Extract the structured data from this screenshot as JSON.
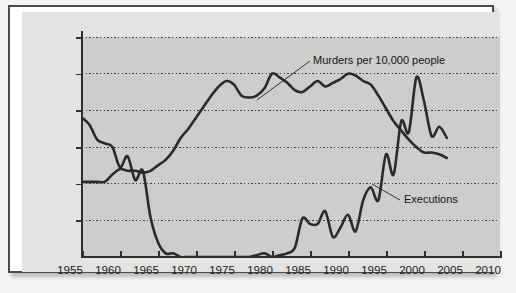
{
  "chart_data": {
    "type": "line",
    "title": "",
    "xlabel": "",
    "ylabel": "",
    "xlim": [
      1955,
      2010
    ],
    "ylim": [
      0,
      120
    ],
    "grid": true,
    "grid_style": "dotted horizontal",
    "legend": "inline annotations",
    "xticks": [
      "1955",
      "1960",
      "1965",
      "1970",
      "1975",
      "1980",
      "1985",
      "1990",
      "1995",
      "2000",
      "2005",
      "2010"
    ],
    "yticks": [
      "20",
      "40",
      "60",
      "80",
      "100",
      "120"
    ],
    "annotations": [
      {
        "text": "Murders per 10,000 people",
        "series": "murders"
      },
      {
        "text": "Executions",
        "series": "executions"
      }
    ],
    "series": [
      {
        "name": "Murders per 10,000 people",
        "color": "#2a2a2a",
        "x": [
          1955,
          1956,
          1957,
          1958,
          1959,
          1960,
          1961,
          1962,
          1963,
          1964,
          1965,
          1966,
          1967,
          1968,
          1969,
          1970,
          1971,
          1972,
          1973,
          1974,
          1975,
          1976,
          1977,
          1978,
          1979,
          1980,
          1981,
          1982,
          1983,
          1984,
          1985,
          1986,
          1987,
          1988,
          1989,
          1990,
          1991,
          1992,
          1993,
          1994,
          1995,
          1996,
          1997,
          1998,
          1999,
          2000,
          2001,
          2002,
          2003
        ],
        "values": [
          41,
          41,
          41,
          41,
          45,
          48,
          47,
          47,
          46,
          47,
          50,
          53,
          58,
          65,
          70,
          76,
          82,
          88,
          93,
          96,
          94,
          88,
          87,
          88,
          92,
          100,
          98,
          95,
          91,
          90,
          93,
          96,
          93,
          95,
          97,
          100,
          99,
          96,
          94,
          88,
          81,
          74,
          69,
          64,
          60,
          57,
          57,
          56,
          54
        ]
      },
      {
        "name": "Executions",
        "color": "#2a2a2a",
        "x": [
          1955,
          1956,
          1957,
          1958,
          1959,
          1960,
          1961,
          1962,
          1963,
          1964,
          1965,
          1966,
          1967,
          1968,
          1969,
          1970,
          1971,
          1972,
          1973,
          1974,
          1975,
          1976,
          1977,
          1978,
          1979,
          1980,
          1981,
          1982,
          1983,
          1984,
          1985,
          1986,
          1987,
          1988,
          1989,
          1990,
          1991,
          1992,
          1993,
          1994,
          1995,
          1996,
          1997,
          1998,
          1999,
          2000,
          2001,
          2002,
          2003
        ],
        "values": [
          76,
          72,
          64,
          62,
          60,
          49,
          55,
          42,
          47,
          22,
          8,
          2,
          2,
          0,
          0,
          0,
          0,
          0,
          0,
          0,
          0,
          0,
          0,
          1,
          2,
          0,
          1,
          2,
          5,
          21,
          18,
          18,
          25,
          11,
          16,
          23,
          14,
          31,
          38,
          31,
          56,
          45,
          74,
          68,
          98,
          85,
          66,
          71,
          65
        ]
      }
    ]
  },
  "axis": {
    "y_title": "",
    "x_title": ""
  }
}
